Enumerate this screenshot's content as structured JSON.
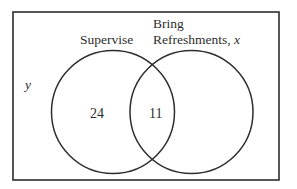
{
  "diagram": {
    "type": "venn",
    "universe_label": "y",
    "sets": [
      {
        "id": "supervise",
        "label": "Supervise",
        "only_count": "24"
      },
      {
        "id": "refreshments",
        "label_line1": "Bring",
        "label_line2": "Refreshments, ",
        "label_var": "x",
        "only_count": ""
      }
    ],
    "intersection_count": "11",
    "colors": {
      "stroke": "#2e2e2e",
      "text": "#2e2e2e",
      "background": "#ffffff"
    }
  }
}
